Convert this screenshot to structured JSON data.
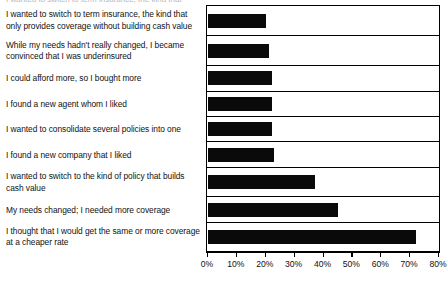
{
  "chart_data": {
    "type": "bar",
    "orientation": "horizontal",
    "title": "I wanted to switch to term insurance, the kind that",
    "xlabel": "",
    "ylabel": "",
    "xlim": [
      0,
      80
    ],
    "grid": false,
    "legend": "none",
    "tick_labels": [
      "0%",
      "10%",
      "20%",
      "30%",
      "40%",
      "50%",
      "60%",
      "70%",
      "80%"
    ],
    "ticks": [
      0,
      10,
      20,
      30,
      40,
      50,
      60,
      70,
      80
    ],
    "categories": [
      "I wanted to switch to term insurance, the kind that only provides coverage without building cash value",
      "While my needs hadn't really changed, I became convinced that I was underinsured",
      "I could afford more, so I bought more",
      "I found a new agent whom I liked",
      "I wanted to consolidate several policies into one",
      "I found a new company that I liked",
      "I wanted to switch to the kind of policy that builds cash value",
      "My needs changed; I needed more coverage",
      "I thought that I would get the same or more coverage at a cheaper rate"
    ],
    "values": [
      20,
      21,
      22,
      22,
      22,
      23,
      37,
      45,
      72
    ],
    "bar_color": "#0a0a0a",
    "plot_background": "#ffffff",
    "axis_color": "#000000"
  }
}
